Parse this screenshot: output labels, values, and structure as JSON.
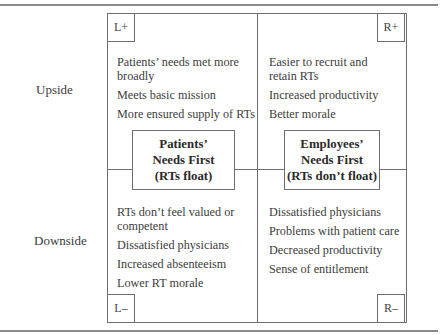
{
  "diagram": {
    "row_labels": {
      "upside": "Upside",
      "downside": "Downside"
    },
    "quadrants": {
      "top_left": {
        "tag": "L+",
        "items": [
          "Patients’ needs met more broadly",
          "Meets basic mission",
          "More ensured supply of RTs"
        ]
      },
      "top_right": {
        "tag": "R+",
        "items": [
          "Easier to recruit and retain RTs",
          "Increased productivity",
          "Better morale"
        ]
      },
      "bottom_left": {
        "tag": "L–",
        "items": [
          "RTs don’t feel valued or competent",
          "Dissatisfied physicians",
          "Increased absenteeism",
          "Lower RT morale"
        ]
      },
      "bottom_right": {
        "tag": "R–",
        "items": [
          "Dissatisfied physicians",
          "Problems with patient care",
          "Decreased productivity",
          "Sense of entitlement"
        ]
      }
    },
    "poles": {
      "left": {
        "line1": "Patients’",
        "line2": "Needs First",
        "line3": "(RTs float)"
      },
      "right": {
        "line1": "Employees’",
        "line2": "Needs First",
        "line3": "(RTs don’t float)"
      }
    },
    "colors": {
      "line": "#6e6e6e",
      "rule": "#8a8a8a",
      "text": "#3a3a3a"
    }
  }
}
